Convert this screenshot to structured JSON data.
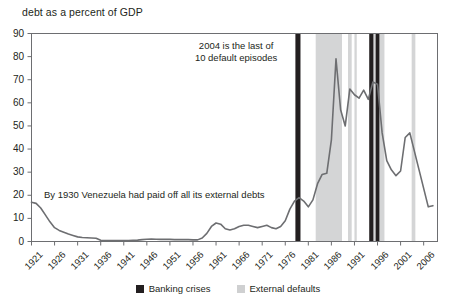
{
  "chart_data": {
    "type": "line",
    "title": "debt as a percent of GDP",
    "xlabel": "",
    "ylabel": "",
    "ylim": [
      0,
      90
    ],
    "xlim": [
      1921,
      2009
    ],
    "grid": false,
    "legend_position": "bottom-center",
    "y_ticks": [
      "0",
      "10",
      "20",
      "30",
      "40",
      "50",
      "60",
      "70",
      "80",
      "90"
    ],
    "x_ticks": [
      "1921",
      "1926",
      "1931",
      "1936",
      "1941",
      "1946",
      "1951",
      "1956",
      "1961",
      "1966",
      "1971",
      "1976",
      "1981",
      "1986",
      "1991",
      "1996",
      "2001",
      "2006"
    ],
    "series": [
      {
        "name": "debt as a percent of GDP",
        "color": "#6d6e71",
        "x": [
          1921,
          1922,
          1923,
          1924,
          1925,
          1926,
          1927,
          1928,
          1929,
          1930,
          1931,
          1932,
          1933,
          1934,
          1935,
          1936,
          1937,
          1938,
          1939,
          1940,
          1941,
          1942,
          1943,
          1944,
          1945,
          1946,
          1947,
          1948,
          1949,
          1950,
          1951,
          1952,
          1953,
          1954,
          1955,
          1956,
          1957,
          1958,
          1959,
          1960,
          1961,
          1962,
          1963,
          1964,
          1965,
          1966,
          1967,
          1968,
          1969,
          1970,
          1971,
          1972,
          1973,
          1974,
          1975,
          1976,
          1977,
          1978,
          1979,
          1980,
          1981,
          1982,
          1983,
          1984,
          1985,
          1986,
          1987,
          1988,
          1989,
          1990,
          1991,
          1992,
          1993,
          1994,
          1995,
          1996,
          1997,
          1998,
          1999,
          2000,
          2001,
          2002,
          2003,
          2004,
          2005,
          2006,
          2007,
          2008
        ],
        "y": [
          17.0,
          16.5,
          14.5,
          11.5,
          8.5,
          6.0,
          4.8,
          4.0,
          3.2,
          2.6,
          2.0,
          1.7,
          1.6,
          1.5,
          1.4,
          0.5,
          0.4,
          0.4,
          0.4,
          0.4,
          0.4,
          0.4,
          0.5,
          0.6,
          0.8,
          1.0,
          1.1,
          1.0,
          0.9,
          0.9,
          0.9,
          0.8,
          0.8,
          0.8,
          0.8,
          0.7,
          0.7,
          1.5,
          3.5,
          6.5,
          8.0,
          7.5,
          5.5,
          5.0,
          5.5,
          6.5,
          7.0,
          7.0,
          6.5,
          6.0,
          6.5,
          7.0,
          6.0,
          5.5,
          6.5,
          9.0,
          14.0,
          17.5,
          19.0,
          17.5,
          15.0,
          18.0,
          25.0,
          29.0,
          29.5,
          44.0,
          79.0,
          57.0,
          50.0,
          66.0,
          63.5,
          62.0,
          65.5,
          61.5,
          69.0,
          68.0,
          47.0,
          35.0,
          31.0,
          28.5,
          30.5,
          45.0,
          47.0,
          39.0,
          31.0,
          23.0,
          15.0,
          15.5
        ]
      }
    ],
    "banking_crises": [
      {
        "label": "banking-crisis-band",
        "start": 1978.2,
        "end": 1979.3
      },
      {
        "label": "banking-crisis-band",
        "start": 1994.2,
        "end": 1995.1
      },
      {
        "label": "banking-crisis-band",
        "start": 1995.6,
        "end": 1996.4
      }
    ],
    "external_defaults": [
      {
        "label": "external-default-band",
        "start": 1982.6,
        "end": 1988.3
      },
      {
        "label": "external-default-band",
        "start": 1989.6,
        "end": 1990.4
      },
      {
        "label": "external-default-band",
        "start": 1991.0,
        "end": 1991.5
      },
      {
        "label": "external-default-band",
        "start": 1995.0,
        "end": 1997.5
      },
      {
        "label": "external-default-band",
        "start": 2003.4,
        "end": 2004.2
      }
    ],
    "annotations": [
      {
        "name": "default-episodes-annotation",
        "line1": "2004 is the last of",
        "line2": "10 default episodes"
      },
      {
        "name": "venezuela-debt-annotation",
        "text": "By 1930 Venezuela had paid off all its external debts"
      }
    ],
    "legend": [
      {
        "name": "legend-banking-crises",
        "label": "Banking crises",
        "color": "#231f20"
      },
      {
        "name": "legend-external-defaults",
        "label": "External defaults",
        "color": "#cfd0d1"
      }
    ],
    "colors": {
      "line": "#6d6e71",
      "axis": "#6d6e71",
      "banking": "#231f20",
      "defaults": "#d4d5d6",
      "text": "#231f20"
    }
  }
}
